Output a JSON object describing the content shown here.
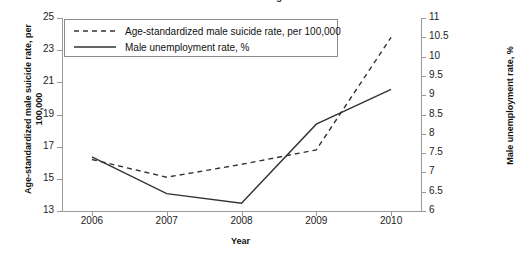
{
  "chart_data": {
    "type": "line",
    "title": "Men's Program",
    "xlabel": "Year",
    "ylabel": "Age-standardized male suicide rate, per 100,000",
    "y2label": "Male unemployment rate, %",
    "categories": [
      "2006",
      "2007",
      "2008",
      "2009",
      "2010"
    ],
    "x": [
      2006,
      2007,
      2008,
      2009,
      2010
    ],
    "xlim": [
      2005.6,
      2010.4
    ],
    "ylim": [
      13,
      25
    ],
    "y2lim": [
      6,
      11
    ],
    "yticks": [
      "13",
      "15",
      "17",
      "19",
      "21",
      "23",
      "25"
    ],
    "ytick_values": [
      13,
      15,
      17,
      19,
      21,
      23,
      25
    ],
    "y2ticks": [
      "6",
      "6.5",
      "7",
      "7.5",
      "8",
      "8.5",
      "9",
      "9.5",
      "10",
      "10.5",
      "11"
    ],
    "y2tick_values": [
      6,
      6.5,
      7,
      7.5,
      8,
      8.5,
      9,
      9.5,
      10,
      10.5,
      11
    ],
    "grid": false,
    "legend_position": "top-left",
    "series": [
      {
        "name": "Age-standardized male suicide rate, per 100,000",
        "axis": "left",
        "style": "dashed",
        "color": "#333333",
        "values": [
          16.2,
          15.1,
          15.9,
          16.8,
          23.8
        ]
      },
      {
        "name": "Male unemployment rate, %",
        "axis": "right",
        "style": "solid",
        "color": "#333333",
        "values": [
          7.4,
          6.45,
          6.2,
          8.25,
          9.15
        ]
      }
    ]
  },
  "legend": {
    "items": [
      {
        "label": "Age-standardized male suicide rate, per 100,000",
        "style": "dashed"
      },
      {
        "label": "Male unemployment rate, %",
        "style": "solid"
      }
    ]
  }
}
